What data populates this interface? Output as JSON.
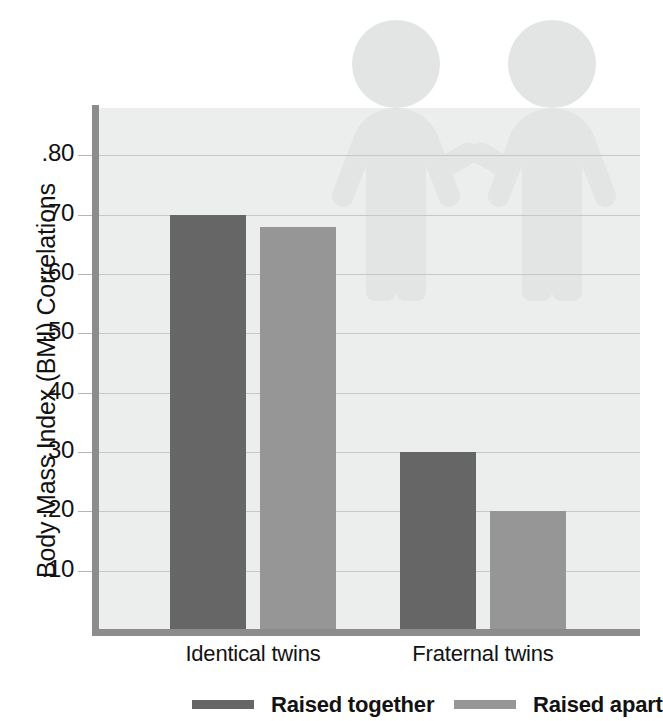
{
  "chart_data": {
    "type": "bar",
    "title": "",
    "xlabel": "",
    "ylabel": "Body Mass Index (BMI) Correlations",
    "categories": [
      "Identical twins",
      "Fraternal twins"
    ],
    "series": [
      {
        "name": "Raised together",
        "color": "#666666",
        "values": [
          0.7,
          0.3
        ]
      },
      {
        "name": "Raised apart",
        "color": "#969696",
        "values": [
          0.68,
          0.2
        ]
      }
    ],
    "ylim": [
      0.0,
      0.88
    ],
    "ytick_values": [
      0.1,
      0.2,
      0.3,
      0.4,
      0.5,
      0.6,
      0.7,
      0.8
    ],
    "ytick_labels": [
      ".10",
      ".20",
      ".30",
      ".40",
      ".50",
      ".60",
      ".70",
      ".80"
    ],
    "grid": true,
    "legend_position": "bottom",
    "plot_background": "#eceded",
    "axis_color": "#8c8c8c",
    "gridline_color": "#c6c7c7"
  },
  "decoration": {
    "watermark_name": "two-twin-figures-holding-hands",
    "watermark_color": "#e2e3e3"
  },
  "legend": {
    "items": [
      {
        "label": "Raised together",
        "color": "#666666"
      },
      {
        "label": "Raised apart",
        "color": "#969696"
      }
    ]
  }
}
